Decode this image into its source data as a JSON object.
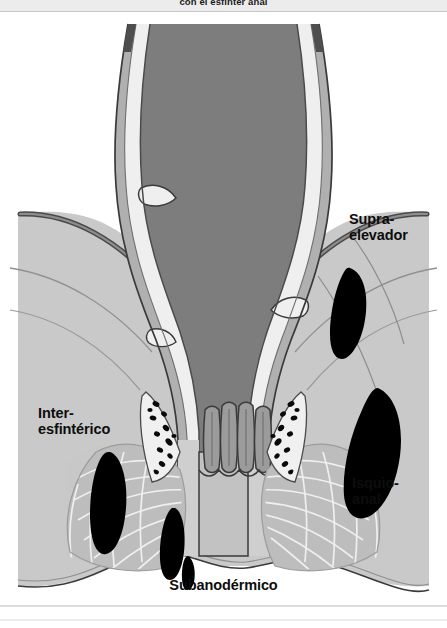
{
  "figure": {
    "title_top": "con el esfínter anal",
    "type": "anatomical-cross-section",
    "labels": [
      {
        "id": "supra",
        "text": "Supra-\nelevador",
        "region": "supralevator-abscess"
      },
      {
        "id": "inter",
        "text": "Inter-\nesfintérico",
        "region": "intersphincteric-abscess"
      },
      {
        "id": "isquio",
        "text": "Isquio-\nanal",
        "region": "ischioanal-abscess"
      },
      {
        "id": "suban",
        "text": "Subanodérmico",
        "region": "subanodermal-abscess"
      }
    ],
    "structures": [
      "rectal-lumen",
      "rectal-mucosa",
      "internal-anal-sphincter",
      "external-anal-sphincter",
      "levator-ani-muscle",
      "anal-columns",
      "anal-glands",
      "ischioanal-fat",
      "perianal-skin"
    ],
    "abscess_count": 5
  },
  "colors": {
    "background": "#ffffff",
    "lumen": "#7d7d7d",
    "mucosa": "#e9e9e9",
    "tissue_light": "#c9c9c9",
    "tissue_mid": "#b4b4b4",
    "fat": "#c4c4c4",
    "sphincter": "#9a9a9a",
    "abscess": "#000000",
    "outline": "#3a3a3a",
    "label_text": "#0d0d0d",
    "frame_line": "#b9b9b9"
  }
}
